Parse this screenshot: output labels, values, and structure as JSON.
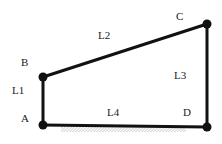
{
  "diagram": {
    "type": "four-bar linkage",
    "joints": [
      {
        "id": "A",
        "x": 43,
        "y": 125
      },
      {
        "id": "B",
        "x": 43,
        "y": 77
      },
      {
        "id": "C",
        "x": 207,
        "y": 24
      },
      {
        "id": "D",
        "x": 207,
        "y": 127
      }
    ],
    "links": [
      {
        "id": "L1",
        "from": "A",
        "to": "B"
      },
      {
        "id": "L2",
        "from": "B",
        "to": "C"
      },
      {
        "id": "L3",
        "from": "C",
        "to": "D"
      },
      {
        "id": "L4",
        "from": "A",
        "to": "D"
      }
    ],
    "labels": {
      "A": "A",
      "B": "B",
      "C": "C",
      "D": "D",
      "L1": "L1",
      "L2": "L2",
      "L3": "L3",
      "L4": "L4"
    },
    "ground": {
      "hatched": true,
      "x_start": 61,
      "x_end": 186
    }
  }
}
